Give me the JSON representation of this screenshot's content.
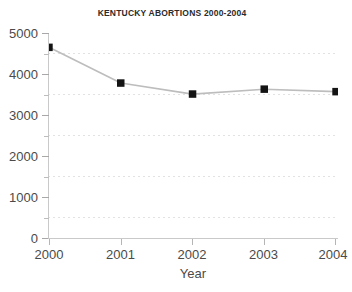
{
  "chart_data": {
    "type": "line",
    "title": "KENTUCKY ABORTIONS 2000-2004",
    "xlabel": "Year",
    "ylabel": "",
    "categories": [
      "2000",
      "2001",
      "2002",
      "2003",
      "2004"
    ],
    "x": [
      2000,
      2001,
      2002,
      2003,
      2004
    ],
    "values": [
      4650,
      3780,
      3510,
      3630,
      3570
    ],
    "series": [
      {
        "name": "Kentucky abortions",
        "values": [
          4650,
          3780,
          3510,
          3630,
          3570
        ]
      }
    ],
    "ylim": [
      0,
      5000
    ],
    "xlim": [
      2000,
      2004
    ],
    "y_ticks_major": [
      0,
      1000,
      2000,
      3000,
      4000,
      5000
    ],
    "y_tick_labels": [
      "0",
      "1000",
      "2000",
      "3000",
      "4000",
      "5000"
    ],
    "y_ticks_minor": [
      500,
      1500,
      2500,
      3500,
      4500
    ],
    "x_tick_labels": [
      "2000",
      "2001",
      "2002",
      "2003",
      "2004"
    ],
    "grid": "horizontal-dashed-minor",
    "legend": "none",
    "marker": "square",
    "colors": {
      "background": "#ffffff",
      "line": "#b9b9b9",
      "marker": "#111111",
      "axis": "#c9c9c9",
      "grid": "#e2e2e2",
      "text": "#4a4a4a",
      "title_text": "#2b2b2b"
    }
  }
}
